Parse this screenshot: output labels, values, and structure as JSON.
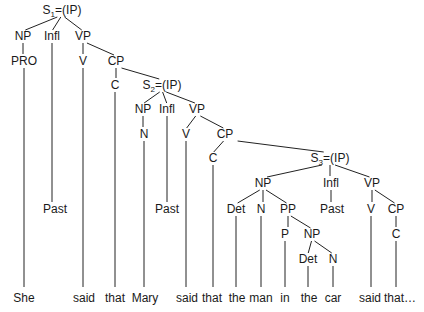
{
  "nodes": [
    {
      "id": "s1",
      "label": "S",
      "sub": "1",
      "suffix": "=(IP)"
    },
    {
      "id": "np1",
      "label": "NP"
    },
    {
      "id": "infl1",
      "label": "Infl"
    },
    {
      "id": "vp1",
      "label": "VP"
    },
    {
      "id": "pro1",
      "label": "PRO"
    },
    {
      "id": "v1",
      "label": "V"
    },
    {
      "id": "cp1",
      "label": "CP"
    },
    {
      "id": "c1",
      "label": "C"
    },
    {
      "id": "s2",
      "label": "S",
      "sub": "2",
      "suffix": "=(IP)"
    },
    {
      "id": "np2",
      "label": "NP"
    },
    {
      "id": "infl2",
      "label": "Infl"
    },
    {
      "id": "vp2",
      "label": "VP"
    },
    {
      "id": "n2",
      "label": "N"
    },
    {
      "id": "v2",
      "label": "V"
    },
    {
      "id": "cp2",
      "label": "CP"
    },
    {
      "id": "c2",
      "label": "C"
    },
    {
      "id": "s3",
      "label": "S",
      "sub": "3",
      "suffix": "=(IP)"
    },
    {
      "id": "np3",
      "label": "NP"
    },
    {
      "id": "infl3",
      "label": "Infl"
    },
    {
      "id": "vp3",
      "label": "VP"
    },
    {
      "id": "past1",
      "label": "Past"
    },
    {
      "id": "past2",
      "label": "Past"
    },
    {
      "id": "det3",
      "label": "Det"
    },
    {
      "id": "n3",
      "label": "N"
    },
    {
      "id": "pp3",
      "label": "PP"
    },
    {
      "id": "past3",
      "label": "Past"
    },
    {
      "id": "v3",
      "label": "V"
    },
    {
      "id": "cp3",
      "label": "CP"
    },
    {
      "id": "p3",
      "label": "P"
    },
    {
      "id": "np4",
      "label": "NP"
    },
    {
      "id": "c3",
      "label": "C"
    },
    {
      "id": "det4",
      "label": "Det"
    },
    {
      "id": "n4",
      "label": "N"
    }
  ],
  "edges": [
    [
      "s1",
      "np1"
    ],
    [
      "s1",
      "infl1"
    ],
    [
      "s1",
      "vp1"
    ],
    [
      "np1",
      "pro1"
    ],
    [
      "vp1",
      "v1"
    ],
    [
      "vp1",
      "cp1"
    ],
    [
      "cp1",
      "c1"
    ],
    [
      "cp1",
      "s2"
    ],
    [
      "s2",
      "np2"
    ],
    [
      "s2",
      "infl2"
    ],
    [
      "s2",
      "vp2"
    ],
    [
      "np2",
      "n2"
    ],
    [
      "vp2",
      "v2"
    ],
    [
      "vp2",
      "cp2"
    ],
    [
      "cp2",
      "c2"
    ],
    [
      "cp2",
      "s3"
    ],
    [
      "s3",
      "np3"
    ],
    [
      "s3",
      "infl3"
    ],
    [
      "s3",
      "vp3"
    ],
    [
      "infl1",
      "past1"
    ],
    [
      "infl2",
      "past2"
    ],
    [
      "infl3",
      "past3"
    ],
    [
      "np3",
      "det3"
    ],
    [
      "np3",
      "n3"
    ],
    [
      "np3",
      "pp3"
    ],
    [
      "vp3",
      "v3"
    ],
    [
      "vp3",
      "cp3"
    ],
    [
      "pp3",
      "p3"
    ],
    [
      "pp3",
      "np4"
    ],
    [
      "cp3",
      "c3"
    ],
    [
      "np4",
      "det4"
    ],
    [
      "np4",
      "n4"
    ]
  ],
  "words": [
    {
      "text": "She",
      "parent": "pro1"
    },
    {
      "text": "said",
      "parent": "v1"
    },
    {
      "text": "that",
      "parent": "c1"
    },
    {
      "text": "Mary",
      "parent": "n2"
    },
    {
      "text": "said",
      "parent": "v2"
    },
    {
      "text": "that",
      "parent": "c2"
    },
    {
      "text": "the",
      "parent": "det3"
    },
    {
      "text": "man",
      "parent": "n3"
    },
    {
      "text": "in",
      "parent": "p3"
    },
    {
      "text": "the",
      "parent": "det4"
    },
    {
      "text": "car",
      "parent": "n4"
    },
    {
      "text": "said",
      "parent": "v3"
    },
    {
      "text": "that…",
      "parent": "c3"
    }
  ]
}
